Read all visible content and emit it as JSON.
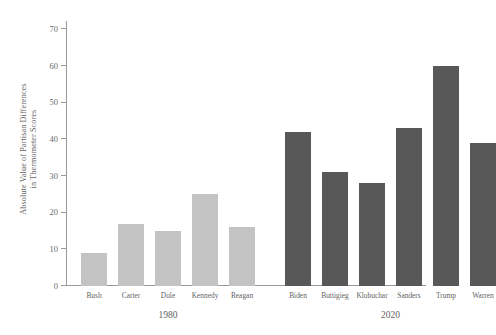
{
  "chart_data": {
    "type": "bar",
    "title": "",
    "xlabel": "",
    "ylabel": "Absolute Value of Partisan Differences\nin Thermometer Scores",
    "ylim": [
      0,
      72
    ],
    "ytick_labels": [
      "0",
      "10",
      "20",
      "30",
      "40",
      "50",
      "60",
      "70"
    ],
    "yticks": [
      0,
      10,
      20,
      30,
      40,
      50,
      60,
      70
    ],
    "grid": false,
    "legend": "none",
    "groups": [
      {
        "name": "1980",
        "color": "#c3c3c3",
        "categories": [
          "Bush",
          "Carter",
          "Dole",
          "Kennedy",
          "Reagan"
        ],
        "values": [
          9,
          17,
          15,
          25,
          16
        ]
      },
      {
        "name": "2020",
        "color": "#585858",
        "categories": [
          "Biden",
          "Buttigieg",
          "Klobuchar",
          "Sanders",
          "Trump",
          "Warren"
        ],
        "values": [
          42,
          31,
          28,
          43,
          60,
          39
        ]
      }
    ],
    "categories": [
      "Bush",
      "Carter",
      "Dole",
      "Kennedy",
      "Reagan",
      "Biden",
      "Buttigieg",
      "Klobuchar",
      "Sanders",
      "Trump",
      "Warren"
    ],
    "values": [
      9,
      17,
      15,
      25,
      16,
      42,
      31,
      28,
      43,
      60,
      39
    ]
  },
  "colors": {
    "bar_1980": "#c3c3c3",
    "bar_2020": "#585858",
    "axis": "#9a9a9a",
    "text": "#5f5f5f",
    "background": "#ffffff"
  }
}
